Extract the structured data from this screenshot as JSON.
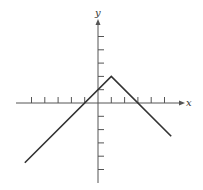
{
  "chart_data": {
    "type": "line",
    "title": "",
    "xlabel": "x",
    "ylabel": "y",
    "function": "y = -|x - 1| + 2",
    "xlim": [
      -6,
      6.5
    ],
    "ylim": [
      -6,
      6
    ],
    "grid": false,
    "legend": null,
    "x_ticks": [
      -5,
      -4,
      -3,
      -2,
      -1,
      1,
      2,
      3,
      4,
      5
    ],
    "y_ticks": [
      -5,
      -4,
      -3,
      -2,
      -1,
      1,
      2,
      3,
      4,
      5
    ],
    "tick_labels_shown": false,
    "series": [
      {
        "name": "f(x)",
        "x": [
          -5.5,
          1,
          5.5
        ],
        "y": [
          -4.5,
          2,
          -2.5
        ]
      }
    ],
    "vertex": [
      1,
      2
    ],
    "x_intercepts": [
      -1,
      3
    ],
    "y_intercept": 1
  },
  "style": {
    "axis_color": "#555555",
    "line_color": "#333333"
  }
}
